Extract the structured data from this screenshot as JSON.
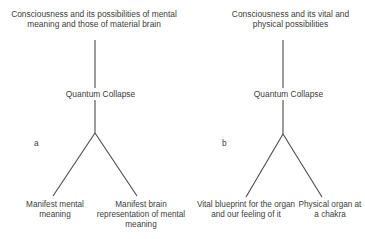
{
  "figure": {
    "background_color": "#ffffff",
    "line_color": "#4a4a4a",
    "text_color": "#3d3d3d",
    "width": 365,
    "height": 239
  },
  "panels": [
    {
      "letter": "a",
      "root_label": "Consciousness and its possibilities of mental meaning and those of material brain",
      "node_label": "Quantum Collapse",
      "leaves": [
        "Manifest mental meaning",
        "Manifest brain representation of mental meaning"
      ]
    },
    {
      "letter": "b",
      "root_label": "Consciousness and its vital and physical possibilities",
      "node_label": "Quantum Collapse",
      "leaves": [
        "Vital blueprint for the organ and our feeling of it",
        "Physical organ at a chakra"
      ]
    }
  ]
}
